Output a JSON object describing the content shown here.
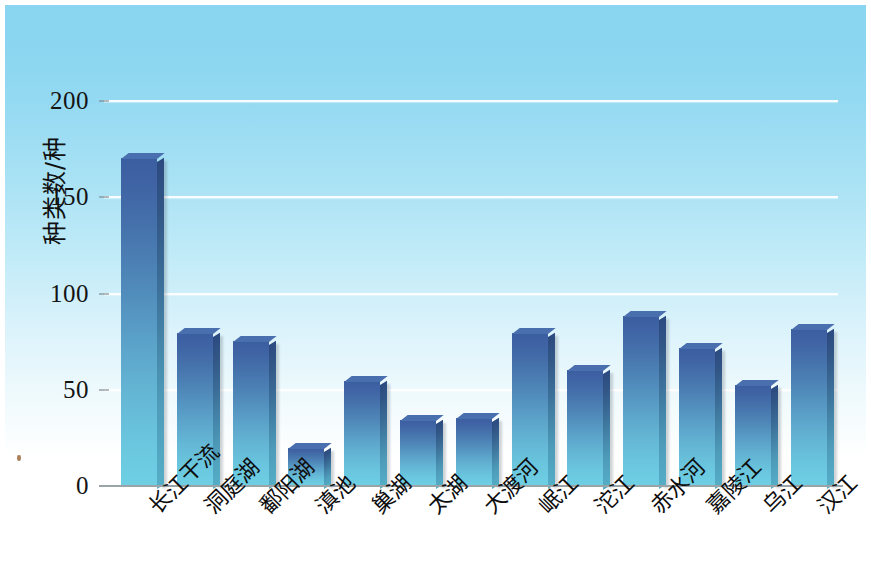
{
  "chart_data": {
    "type": "bar",
    "title": "",
    "xlabel": "",
    "ylabel": "种类数/种",
    "ylim": [
      0,
      200
    ],
    "yticks": [
      0,
      50,
      100,
      150,
      200
    ],
    "ytick_labels": [
      "0",
      "50",
      "100",
      "150",
      "200"
    ],
    "grid": "horizontal",
    "legend": "none",
    "categories": [
      "长江干流",
      "洞庭湖",
      "鄱阳湖",
      "滇池",
      "巢湖",
      "太湖",
      "大渡河",
      "岷江",
      "沱江",
      "赤水河",
      "嘉陵江",
      "乌江",
      "汉江"
    ],
    "values": [
      170,
      79,
      75,
      19,
      54,
      34,
      35,
      79,
      60,
      88,
      71,
      52,
      81
    ],
    "series": [
      {
        "name": "种类数",
        "values": [
          170,
          79,
          75,
          19,
          54,
          34,
          35,
          79,
          60,
          88,
          71,
          52,
          81
        ]
      }
    ],
    "colors": {
      "bar_top": "#3b5ea0",
      "bar_bottom": "#6ecfe3",
      "bar_side": "#2c4a80",
      "bar_cap": "#4a6fae",
      "background_top": "#8ad5f0",
      "background_bottom": "#ffffff",
      "gridline": "#ffffff",
      "axis": "#9aa3a8",
      "text": "#101010"
    }
  }
}
